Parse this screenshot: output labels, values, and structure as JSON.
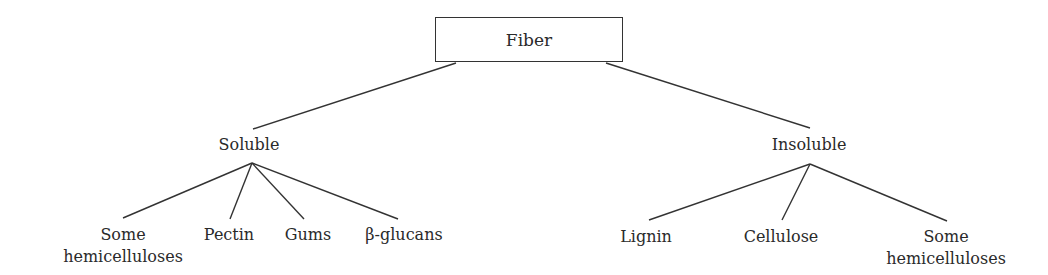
{
  "root": {
    "label": "Fiber"
  },
  "categories": [
    {
      "label": "Soluble",
      "children": [
        "Some hemicelluloses",
        "Pectin",
        "Gums",
        "β-glucans"
      ]
    },
    {
      "label": "Insoluble",
      "children": [
        "Lignin",
        "Cellulose",
        "Some hemicelluloses"
      ]
    }
  ],
  "labels": {
    "soluble_children": [
      {
        "line1": "Some",
        "line2": "hemicelluloses"
      },
      {
        "line1": "Pectin"
      },
      {
        "line1": "Gums"
      },
      {
        "line1": "β-glucans"
      }
    ],
    "insoluble_children": [
      {
        "line1": "Lignin"
      },
      {
        "line1": "Cellulose"
      },
      {
        "line1": "Some",
        "line2": "hemicelluloses"
      }
    ]
  }
}
